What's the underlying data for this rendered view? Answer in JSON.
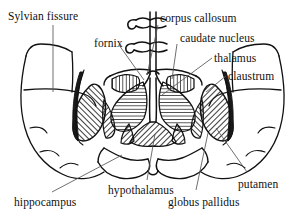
{
  "figure": {
    "type": "anatomical-diagram",
    "view": "coronal",
    "background_color": "#ffffff",
    "ink_color": "#111111",
    "hatch_color": "#1a1a1a"
  },
  "labels": [
    {
      "id": "sylvian-fissure",
      "text": "Sylvian fissure",
      "x": 8,
      "y": 10
    },
    {
      "id": "corpus-callosum",
      "text": "corpus callosum",
      "x": 160,
      "y": 12
    },
    {
      "id": "fornix",
      "text": "fornix",
      "x": 94,
      "y": 37
    },
    {
      "id": "caudate-nucleus",
      "text": "caudate nucleus",
      "x": 180,
      "y": 32
    },
    {
      "id": "thalamus",
      "text": "thalamus",
      "x": 214,
      "y": 52
    },
    {
      "id": "claustrum",
      "text": "claustrum",
      "x": 228,
      "y": 70
    },
    {
      "id": "hippocampus",
      "text": "hippocampus",
      "x": 14,
      "y": 196
    },
    {
      "id": "hypothalamus",
      "text": "hypothalamus",
      "x": 108,
      "y": 184
    },
    {
      "id": "globus-pallidus",
      "text": "globus pallidus",
      "x": 168,
      "y": 196
    },
    {
      "id": "putamen",
      "text": "putamen",
      "x": 238,
      "y": 178
    }
  ],
  "leader_lines": [
    {
      "id": "leader-sylvian-fissure",
      "from": [
        53,
        25
      ],
      "to": [
        53,
        92
      ]
    },
    {
      "id": "leader-corpus-callosum",
      "from": [
        158,
        25
      ],
      "to": [
        147,
        75
      ]
    },
    {
      "id": "leader-fornix",
      "from": [
        119,
        45
      ],
      "to": [
        144,
        80
      ]
    },
    {
      "id": "leader-caudate-nucleus",
      "from": [
        177,
        44
      ],
      "to": [
        172,
        79
      ]
    },
    {
      "id": "leader-thalamus",
      "from": [
        212,
        58
      ],
      "to": [
        162,
        95
      ]
    },
    {
      "id": "leader-claustrum",
      "from": [
        226,
        76
      ],
      "to": [
        206,
        92
      ]
    },
    {
      "id": "leader-hippocampus",
      "from": [
        52,
        192
      ],
      "to": [
        122,
        155
      ]
    },
    {
      "id": "leader-hypothalamus",
      "from": [
        147,
        180
      ],
      "to": [
        155,
        134
      ]
    },
    {
      "id": "leader-globus-pallidus",
      "from": [
        196,
        190
      ],
      "to": [
        208,
        133
      ]
    },
    {
      "id": "leader-putamen",
      "from": [
        247,
        172
      ],
      "to": [
        216,
        128
      ]
    }
  ],
  "structures": [
    {
      "id": "cortex-outline",
      "name": "cerebral cortex outline",
      "fill": "none"
    },
    {
      "id": "putamen-left",
      "name": "putamen (left)",
      "fill": "diagonal-hatch"
    },
    {
      "id": "putamen-right",
      "name": "putamen (right)",
      "fill": "diagonal-hatch"
    },
    {
      "id": "globus-pallidus-left",
      "name": "globus pallidus (left)",
      "fill": "diagonal-hatch"
    },
    {
      "id": "globus-pallidus-right",
      "name": "globus pallidus (right)",
      "fill": "diagonal-hatch"
    },
    {
      "id": "thalamus-left",
      "name": "thalamus (left)",
      "fill": "horizontal-hatch"
    },
    {
      "id": "thalamus-right",
      "name": "thalamus (right)",
      "fill": "horizontal-hatch"
    },
    {
      "id": "caudate-left",
      "name": "caudate nucleus (left)",
      "fill": "vertical-hatch"
    },
    {
      "id": "caudate-right",
      "name": "caudate nucleus (right)",
      "fill": "vertical-hatch"
    },
    {
      "id": "claustrum-left",
      "name": "claustrum (left)",
      "fill": "solid"
    },
    {
      "id": "claustrum-right",
      "name": "claustrum (right)",
      "fill": "solid"
    },
    {
      "id": "hypothalamus-body",
      "name": "hypothalamus",
      "fill": "diagonal-hatch"
    },
    {
      "id": "corpus-callosum-body",
      "name": "corpus callosum / midline",
      "fill": "none"
    },
    {
      "id": "fornix-body",
      "name": "fornix",
      "fill": "none"
    },
    {
      "id": "hippocampus-region",
      "name": "hippocampus / temporal lobe",
      "fill": "none"
    }
  ]
}
